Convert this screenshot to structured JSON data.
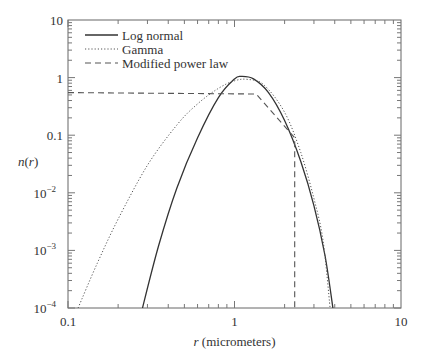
{
  "chart_data": {
    "type": "line",
    "title": "",
    "xlabel_italic": "r",
    "xlabel_rest": " (micrometers)",
    "xlabel": "r (micrometers)",
    "ylabel": "n(r)",
    "xscale": "log",
    "yscale": "log",
    "xlim": [
      0.1,
      10
    ],
    "ylim": [
      0.0001,
      10
    ],
    "grid": false,
    "legend_position": "upper left",
    "x_ticks": [
      {
        "value": 0.1,
        "label": "0.1"
      },
      {
        "value": 1,
        "label": "1"
      },
      {
        "value": 10,
        "label": "10"
      }
    ],
    "y_ticks": [
      {
        "value": 10,
        "label": "10",
        "exp": ""
      },
      {
        "value": 1,
        "label": "1",
        "exp": ""
      },
      {
        "value": 0.1,
        "label": "0.1",
        "exp": ""
      },
      {
        "value": 0.01,
        "label": "10",
        "exp": "−2"
      },
      {
        "value": 0.001,
        "label": "10",
        "exp": "−3"
      },
      {
        "value": 0.0001,
        "label": "10",
        "exp": "−4"
      }
    ],
    "series": [
      {
        "name": "Log normal",
        "style": "solid",
        "x": [
          0.28,
          0.35,
          0.45,
          0.6,
          0.8,
          1.0,
          1.1,
          1.3,
          1.6,
          2.0,
          2.5,
          3.0,
          3.5,
          3.9
        ],
        "y": [
          0.0001,
          0.0012,
          0.012,
          0.09,
          0.45,
          0.95,
          1.05,
          0.95,
          0.55,
          0.18,
          0.035,
          0.006,
          0.0008,
          0.0001
        ]
      },
      {
        "name": "Gamma",
        "style": "dotted",
        "x": [
          0.115,
          0.15,
          0.2,
          0.3,
          0.45,
          0.6,
          0.8,
          1.0,
          1.2,
          1.5,
          2.0,
          2.5,
          3.0,
          3.4,
          3.75
        ],
        "y": [
          0.0001,
          0.0006,
          0.0035,
          0.03,
          0.15,
          0.35,
          0.65,
          0.88,
          0.93,
          0.75,
          0.25,
          0.05,
          0.008,
          0.0015,
          0.0001
        ]
      },
      {
        "name": "Modified power law",
        "style": "dashed",
        "x": [
          0.1,
          1.35,
          2.3,
          2.3
        ],
        "y": [
          0.55,
          0.52,
          0.09,
          0.0001
        ]
      }
    ]
  }
}
